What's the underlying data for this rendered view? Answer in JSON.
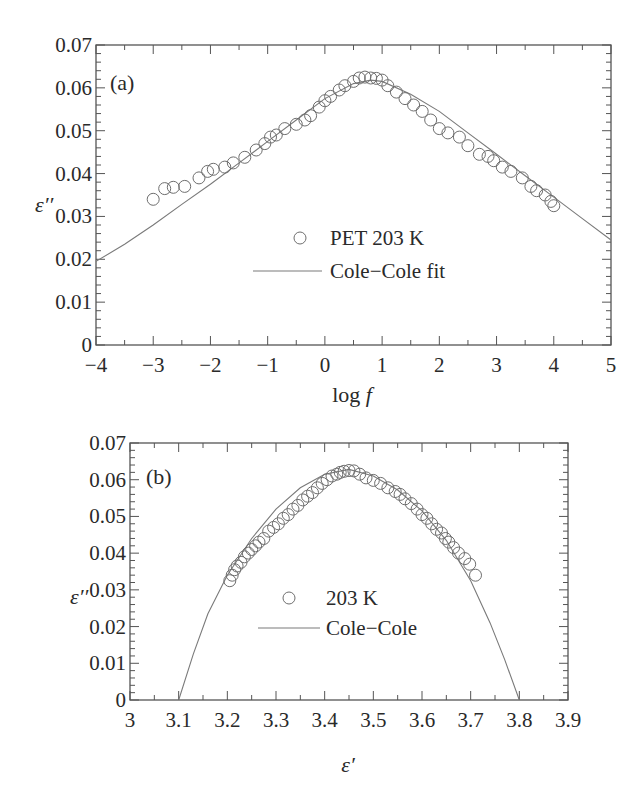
{
  "chart_data": [
    {
      "id": "a",
      "type": "scatter",
      "panel_label": "(a)",
      "title": "",
      "xlabel": "log f",
      "xlabel_parts": {
        "base": "log ",
        "italic": "f"
      },
      "ylabel": "ε′′",
      "xlim": [
        -4,
        5
      ],
      "ylim": [
        0,
        0.07
      ],
      "xticks": [
        -4,
        -3,
        -2,
        -1,
        0,
        1,
        2,
        3,
        4,
        5
      ],
      "xtick_labels": [
        "−4",
        "−3",
        "−2",
        "−1",
        "0",
        "1",
        "2",
        "3",
        "4",
        "5"
      ],
      "yticks": [
        0,
        0.01,
        0.02,
        0.03,
        0.04,
        0.05,
        0.06,
        0.07
      ],
      "ytick_labels": [
        "0",
        "0.01",
        "0.02",
        "0.03",
        "0.04",
        "0.05",
        "0.06",
        "0.07"
      ],
      "grid": false,
      "legend_position": "center",
      "legend": [
        {
          "label": "PET 203 K",
          "marker": "open-circle"
        },
        {
          "label": "Cole−Cole fit",
          "marker": "line"
        }
      ],
      "series": [
        {
          "name": "PET 203 K",
          "kind": "markers",
          "x": [
            -3.0,
            -2.8,
            -2.65,
            -2.45,
            -2.2,
            -2.05,
            -1.95,
            -1.75,
            -1.6,
            -1.4,
            -1.2,
            -1.05,
            -0.95,
            -0.85,
            -0.7,
            -0.5,
            -0.35,
            -0.25,
            -0.1,
            0.0,
            0.1,
            0.25,
            0.35,
            0.5,
            0.6,
            0.7,
            0.8,
            0.9,
            1.0,
            1.1,
            1.25,
            1.4,
            1.55,
            1.7,
            1.85,
            2.0,
            2.15,
            2.35,
            2.5,
            2.7,
            2.85,
            2.95,
            3.1,
            3.25,
            3.45,
            3.6,
            3.7,
            3.85,
            3.95,
            4.0
          ],
          "y": [
            0.034,
            0.0365,
            0.0368,
            0.037,
            0.039,
            0.0405,
            0.041,
            0.0415,
            0.0425,
            0.0438,
            0.0455,
            0.047,
            0.0485,
            0.049,
            0.0505,
            0.0515,
            0.0525,
            0.0535,
            0.0555,
            0.057,
            0.058,
            0.0595,
            0.0605,
            0.0615,
            0.0623,
            0.0625,
            0.0623,
            0.0622,
            0.0618,
            0.0605,
            0.059,
            0.0575,
            0.056,
            0.0545,
            0.0525,
            0.0505,
            0.0495,
            0.0485,
            0.0465,
            0.0445,
            0.044,
            0.043,
            0.0415,
            0.0405,
            0.039,
            0.037,
            0.036,
            0.035,
            0.0335,
            0.0325
          ]
        },
        {
          "name": "Cole−Cole fit",
          "kind": "line",
          "x": [
            -4.0,
            -3.5,
            -3.0,
            -2.5,
            -2.0,
            -1.5,
            -1.0,
            -0.5,
            0.0,
            0.5,
            0.8,
            1.0,
            1.5,
            2.0,
            2.5,
            3.0,
            3.5,
            4.0,
            4.5,
            5.0
          ],
          "y": [
            0.0195,
            0.0235,
            0.028,
            0.0328,
            0.0375,
            0.0425,
            0.0475,
            0.0525,
            0.0575,
            0.061,
            0.0618,
            0.0615,
            0.0585,
            0.0545,
            0.0495,
            0.0445,
            0.0395,
            0.0345,
            0.0295,
            0.0245
          ]
        }
      ]
    },
    {
      "id": "b",
      "type": "scatter",
      "panel_label": "(b)",
      "title": "",
      "xlabel": "ε′",
      "ylabel": "ε′′",
      "xlim": [
        3.0,
        3.9
      ],
      "ylim": [
        0,
        0.07
      ],
      "xticks": [
        3.0,
        3.1,
        3.2,
        3.3,
        3.4,
        3.5,
        3.6,
        3.7,
        3.8,
        3.9
      ],
      "xtick_labels": [
        "3",
        "3.1",
        "3.2",
        "3.3",
        "3.4",
        "3.5",
        "3.6",
        "3.7",
        "3.8",
        "3.9"
      ],
      "yticks": [
        0,
        0.01,
        0.02,
        0.03,
        0.04,
        0.05,
        0.06,
        0.07
      ],
      "ytick_labels": [
        "0",
        "0.01",
        "0.02",
        "0.03",
        "0.04",
        "0.05",
        "0.06",
        "0.07"
      ],
      "grid": false,
      "legend_position": "center",
      "legend": [
        {
          "label": "203 K",
          "marker": "open-circle"
        },
        {
          "label": "Cole−Cole",
          "marker": "line"
        }
      ],
      "series": [
        {
          "name": "203 K",
          "kind": "markers",
          "x": [
            3.205,
            3.21,
            3.215,
            3.22,
            3.228,
            3.235,
            3.243,
            3.25,
            3.258,
            3.265,
            3.275,
            3.285,
            3.295,
            3.305,
            3.315,
            3.325,
            3.335,
            3.345,
            3.355,
            3.365,
            3.375,
            3.385,
            3.395,
            3.405,
            3.415,
            3.425,
            3.432,
            3.44,
            3.45,
            3.46,
            3.472,
            3.485,
            3.5,
            3.515,
            3.53,
            3.545,
            3.555,
            3.565,
            3.578,
            3.59,
            3.6,
            3.61,
            3.62,
            3.63,
            3.64,
            3.648,
            3.655,
            3.665,
            3.675,
            3.688,
            3.698,
            3.71
          ],
          "y": [
            0.0325,
            0.034,
            0.0355,
            0.0365,
            0.0375,
            0.039,
            0.04,
            0.041,
            0.042,
            0.043,
            0.044,
            0.046,
            0.047,
            0.048,
            0.0495,
            0.0505,
            0.052,
            0.053,
            0.0545,
            0.0555,
            0.0565,
            0.0578,
            0.059,
            0.06,
            0.061,
            0.0615,
            0.062,
            0.0623,
            0.0625,
            0.0624,
            0.0615,
            0.0605,
            0.0598,
            0.059,
            0.0578,
            0.0568,
            0.056,
            0.0548,
            0.0535,
            0.052,
            0.0505,
            0.0495,
            0.048,
            0.0465,
            0.0455,
            0.044,
            0.043,
            0.0415,
            0.04,
            0.0385,
            0.037,
            0.034
          ]
        },
        {
          "name": "Cole−Cole",
          "kind": "line",
          "x": [
            3.1,
            3.13,
            3.16,
            3.2,
            3.25,
            3.3,
            3.35,
            3.4,
            3.45,
            3.5,
            3.55,
            3.6,
            3.65,
            3.7,
            3.74,
            3.77,
            3.8
          ],
          "y": [
            0.0,
            0.0125,
            0.0235,
            0.034,
            0.044,
            0.052,
            0.0578,
            0.0615,
            0.0628,
            0.061,
            0.0572,
            0.0515,
            0.0435,
            0.0325,
            0.021,
            0.011,
            0.0
          ]
        }
      ]
    }
  ],
  "layout": {
    "panels": [
      {
        "left": 96,
        "top": 45,
        "right": 611,
        "bottom": 345,
        "legend": {
          "marker_x": 300,
          "line_x1": 253,
          "line_x2": 322,
          "text_x": 330,
          "row1_y": 245,
          "row2_y": 278
        },
        "panel_label_pos": [
          110,
          90
        ],
        "ylabel_pos": [
          35,
          212
        ],
        "xlabel_pos": [
          352,
          402
        ],
        "minor_x": 2,
        "minor_y": 5
      },
      {
        "left": 130,
        "top": 443,
        "right": 568,
        "bottom": 700,
        "legend": {
          "marker_x": 289,
          "line_x1": 258,
          "line_x2": 320,
          "text_x": 326,
          "row1_y": 605,
          "row2_y": 635
        },
        "panel_label_pos": [
          146,
          484
        ],
        "ylabel_pos": [
          70,
          604
        ],
        "xlabel_pos": [
          348,
          772
        ],
        "minor_x": 2,
        "minor_y": 5
      }
    ],
    "colors": {
      "axis": "#555555",
      "marker": "#6e6e6e",
      "line": "#7a7a7a",
      "text": "#2a2a2a"
    }
  }
}
